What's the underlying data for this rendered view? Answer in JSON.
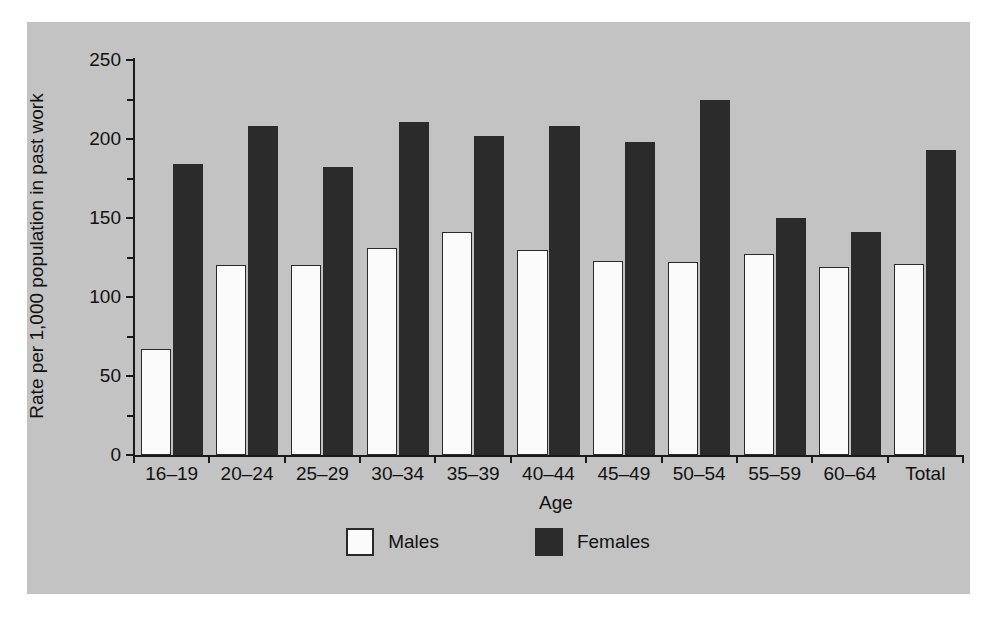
{
  "chart_data": {
    "type": "bar",
    "title": "",
    "xlabel": "Age",
    "ylabel": "Rate per 1,000 population in past work",
    "ylim": [
      0,
      250
    ],
    "yticks": [
      0,
      50,
      100,
      150,
      200,
      250
    ],
    "ytick_labels": [
      "0",
      "50",
      "100",
      "150",
      "200",
      "250"
    ],
    "yminor_ticks": [
      25,
      75,
      125,
      175,
      225
    ],
    "grid": false,
    "legend_position": "bottom-center",
    "categories": [
      "16–19",
      "20–24",
      "25–29",
      "30–34",
      "35–39",
      "40–44",
      "45–49",
      "50–54",
      "55–59",
      "60–64",
      "Total"
    ],
    "series": [
      {
        "name": "Males",
        "color": "#fbfbfb",
        "edge_color": "#2a2a2a",
        "values": [
          67,
          120,
          120,
          131,
          141,
          130,
          123,
          122,
          127,
          119,
          121
        ]
      },
      {
        "name": "Females",
        "color": "#2b2b2b",
        "edge_color": "#2b2b2b",
        "values": [
          184,
          208,
          182,
          211,
          202,
          208,
          198,
          225,
          150,
          141,
          193
        ]
      }
    ]
  },
  "figure": {
    "background": "#ffffff",
    "panel_background": "#c3c3c3",
    "axis_color": "#1a1a1a"
  },
  "legend": {
    "items": [
      {
        "label": "Males",
        "swatch": "white-square-swatch"
      },
      {
        "label": "Females",
        "swatch": "black-square-swatch"
      }
    ]
  }
}
